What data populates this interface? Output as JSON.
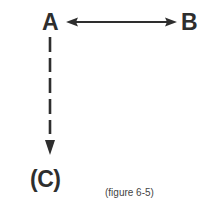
{
  "diagram": {
    "nodes": [
      {
        "id": "A",
        "label": "A"
      },
      {
        "id": "B",
        "label": "B"
      },
      {
        "id": "C",
        "label": "(C)"
      }
    ],
    "edges": [
      {
        "from": "A",
        "to": "B",
        "style": "solid",
        "direction": "bidirectional"
      },
      {
        "from": "A",
        "to": "C",
        "style": "dashed",
        "direction": "forward"
      }
    ],
    "caption": "(figure 6-5)",
    "colors": {
      "ink": "#2e2e2e",
      "background": "#ffffff"
    }
  }
}
